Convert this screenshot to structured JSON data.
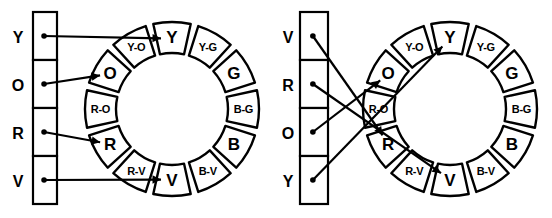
{
  "figure": {
    "type": "color-wheel-matching-diagram",
    "panels": [
      {
        "id": "left-panel",
        "name": "ordered-column-panel",
        "column": {
          "name": "color-list-column",
          "cells": [
            {
              "label": "Y",
              "name": "cell-Y"
            },
            {
              "label": "O",
              "name": "cell-O"
            },
            {
              "label": "R",
              "name": "cell-R"
            },
            {
              "label": "V",
              "name": "cell-V"
            }
          ]
        },
        "wheel": {
          "name": "color-wheel",
          "segments": [
            {
              "label": "Y",
              "kind": "primary"
            },
            {
              "label": "Y-G",
              "kind": "tertiary"
            },
            {
              "label": "G",
              "kind": "primary"
            },
            {
              "label": "B-G",
              "kind": "tertiary"
            },
            {
              "label": "B",
              "kind": "primary"
            },
            {
              "label": "B-V",
              "kind": "tertiary"
            },
            {
              "label": "V",
              "kind": "primary"
            },
            {
              "label": "R-V",
              "kind": "tertiary"
            },
            {
              "label": "R",
              "kind": "primary"
            },
            {
              "label": "R-O",
              "kind": "tertiary"
            },
            {
              "label": "O",
              "kind": "primary"
            },
            {
              "label": "Y-O",
              "kind": "tertiary"
            }
          ]
        },
        "connections": [
          {
            "from": "Y",
            "to": "Y",
            "crossed": false
          },
          {
            "from": "O",
            "to": "O",
            "crossed": false
          },
          {
            "from": "R",
            "to": "R",
            "crossed": false
          },
          {
            "from": "V",
            "to": "V",
            "crossed": false
          }
        ]
      },
      {
        "id": "right-panel",
        "name": "scrambled-column-panel",
        "column": {
          "name": "color-list-column",
          "cells": [
            {
              "label": "V",
              "name": "cell-V"
            },
            {
              "label": "R",
              "name": "cell-R"
            },
            {
              "label": "O",
              "name": "cell-O"
            },
            {
              "label": "Y",
              "name": "cell-Y"
            }
          ]
        },
        "wheel": {
          "name": "color-wheel",
          "segments": [
            {
              "label": "Y",
              "kind": "primary"
            },
            {
              "label": "Y-G",
              "kind": "tertiary"
            },
            {
              "label": "G",
              "kind": "primary"
            },
            {
              "label": "B-G",
              "kind": "tertiary"
            },
            {
              "label": "B",
              "kind": "primary"
            },
            {
              "label": "B-V",
              "kind": "tertiary"
            },
            {
              "label": "V",
              "kind": "primary"
            },
            {
              "label": "R-V",
              "kind": "tertiary"
            },
            {
              "label": "R",
              "kind": "primary"
            },
            {
              "label": "R-O",
              "kind": "tertiary"
            },
            {
              "label": "O",
              "kind": "primary"
            },
            {
              "label": "Y-O",
              "kind": "tertiary"
            }
          ]
        },
        "connections": [
          {
            "from": "V",
            "to": "R",
            "crossed": true
          },
          {
            "from": "R",
            "to": "V",
            "crossed": true
          },
          {
            "from": "O",
            "to": "O",
            "crossed": true
          },
          {
            "from": "Y",
            "to": "Y",
            "crossed": true
          }
        ]
      }
    ],
    "colors": {
      "stroke": "#000000",
      "fill": "#ffffff"
    }
  }
}
